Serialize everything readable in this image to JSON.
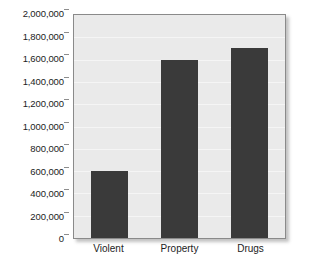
{
  "chart_data": {
    "type": "bar",
    "title": "",
    "subtitle": "",
    "xlabel": "",
    "ylabel": "",
    "categories": [
      "Violent",
      "Property",
      "Drugs"
    ],
    "values": [
      600000,
      1600000,
      1700000
    ],
    "ylim": [
      0,
      2000000
    ],
    "ytick_step": 200000,
    "ytick_labels": [
      "2,000,000",
      "1,800,000",
      "1,600,000",
      "1,400,000",
      "1,200,000",
      "1,000,000",
      "800,000",
      "600,000",
      "400,000",
      "200,000",
      "0"
    ],
    "ytick_values": [
      2000000,
      1800000,
      1600000,
      1400000,
      1200000,
      1000000,
      800000,
      600000,
      400000,
      200000,
      0
    ],
    "grid": true,
    "grid_axis": "y",
    "legend": false,
    "legend_position": "none",
    "colors": {
      "bar": "#3a3a3a",
      "plot_background": "#eaeaea",
      "page_background": "#ffffff",
      "gridline": "#f5f5f5",
      "axis_line": "#8a8a8a",
      "tick_mark": "#8d8d8d",
      "text": "#1c1c1c"
    }
  }
}
